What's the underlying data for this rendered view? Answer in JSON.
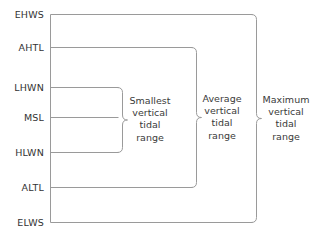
{
  "diagram": {
    "type": "tidal-datum-levels",
    "background_color": "#ffffff",
    "line_color": "#9a9a9a",
    "text_color": "#333333",
    "width": 318,
    "height": 236,
    "axis_x": 50,
    "datums": [
      {
        "id": "ehws",
        "label": "EHWS",
        "y": 14,
        "line_end_x": 252
      },
      {
        "id": "ahtl",
        "label": "AHTL",
        "y": 47,
        "line_end_x": 192
      },
      {
        "id": "lhwn",
        "label": "LHWN",
        "y": 87,
        "line_end_x": 118
      },
      {
        "id": "msl",
        "label": "MSL",
        "y": 117,
        "line_end_x": 118
      },
      {
        "id": "hlwn",
        "label": "HLWN",
        "y": 152,
        "line_end_x": 118
      },
      {
        "id": "altl",
        "label": "ALTL",
        "y": 187,
        "line_end_x": 192
      },
      {
        "id": "elws",
        "label": "ELWS",
        "y": 222,
        "line_end_x": 252
      }
    ],
    "ranges": [
      {
        "id": "smallest",
        "lines": [
          "Smallest",
          "vertical",
          "tidal",
          "range"
        ],
        "brace_x": 122,
        "top_y": 87,
        "bottom_y": 152,
        "text_x": 150,
        "text_y": 119
      },
      {
        "id": "average",
        "lines": [
          "Average",
          "vertical",
          "tidal",
          "range"
        ],
        "brace_x": 196,
        "top_y": 47,
        "bottom_y": 187,
        "text_x": 222,
        "text_y": 117
      },
      {
        "id": "maximum",
        "lines": [
          "Maximum",
          "vertical",
          "tidal",
          "range"
        ],
        "brace_x": 256,
        "top_y": 14,
        "bottom_y": 222,
        "text_x": 286,
        "text_y": 118
      }
    ]
  }
}
